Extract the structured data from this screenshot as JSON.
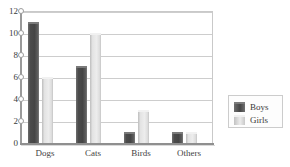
{
  "chart_data": {
    "type": "bar",
    "title": "",
    "xlabel": "",
    "ylabel": "",
    "categories": [
      "Dogs",
      "Cats",
      "Birds",
      "Others"
    ],
    "series": [
      {
        "name": "Boys",
        "color": "#4a4a4a",
        "values": [
          11,
          7,
          1,
          1
        ]
      },
      {
        "name": "Girls",
        "color": "#dedede",
        "values": [
          6,
          10,
          3,
          1
        ]
      }
    ],
    "ylim": [
      0,
      12
    ],
    "yticks": [
      0,
      2,
      4,
      6,
      8,
      10,
      12
    ],
    "ytick_labels": [
      "0",
      "2",
      "4",
      "6",
      "8",
      "10",
      "12"
    ],
    "grid": true,
    "grid_axis": "y",
    "legend_position": "right",
    "legend_entries": [
      "Boys",
      "Girls"
    ]
  },
  "axis": {
    "y_labels": [
      "12",
      "10",
      "8",
      "6",
      "4",
      "2",
      "0"
    ]
  },
  "legend": {
    "boys_label": "Boys",
    "girls_label": "Girls"
  },
  "categories": {
    "c0": "Dogs",
    "c1": "Cats",
    "c2": "Birds",
    "c3": "Others"
  }
}
